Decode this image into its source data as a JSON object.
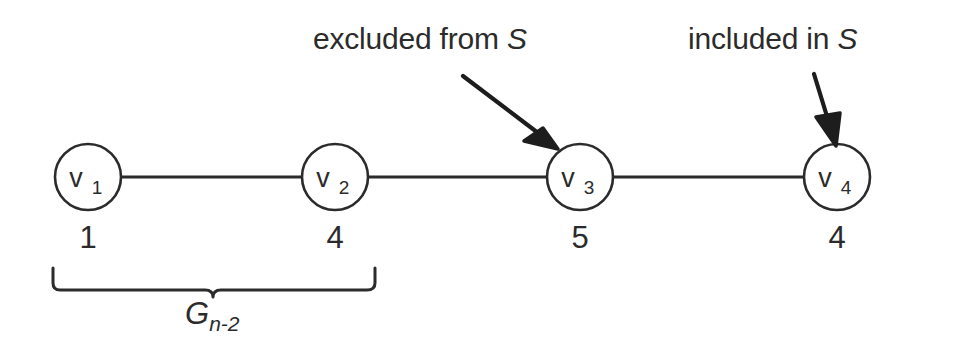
{
  "diagram": {
    "background_color": "#ffffff",
    "stroke_color": "#2b2b2b",
    "node_fill": "#ffffff",
    "callouts": [
      {
        "id": "excluded",
        "text_prefix": "excluded from ",
        "set_name": "S",
        "full_text": "excluded from S",
        "points_to": "v3"
      },
      {
        "id": "included",
        "text_prefix": "included in ",
        "set_name": "S",
        "full_text": "included in S",
        "points_to": "v4"
      }
    ],
    "nodes": [
      {
        "id": "v1",
        "label": "v",
        "subscript": "1",
        "weight": "1",
        "cx": 88,
        "cy": 177,
        "r": 33
      },
      {
        "id": "v2",
        "label": "v",
        "subscript": "2",
        "weight": "4",
        "cx": 335,
        "cy": 177,
        "r": 33
      },
      {
        "id": "v3",
        "label": "v",
        "subscript": "3",
        "weight": "5",
        "cx": 580,
        "cy": 177,
        "r": 33
      },
      {
        "id": "v4",
        "label": "v",
        "subscript": "4",
        "weight": "4",
        "cx": 837,
        "cy": 177,
        "r": 33
      }
    ],
    "edges": [
      {
        "id": "e1",
        "from": "v1",
        "to": "v2"
      },
      {
        "id": "e2",
        "from": "v2",
        "to": "v3"
      },
      {
        "id": "e3",
        "from": "v3",
        "to": "v4"
      }
    ],
    "brace": {
      "id": "subgraph-brace",
      "label_base": "G",
      "label_subscript": "n-2",
      "full_label": "G n-2",
      "spans_nodes": [
        "v1",
        "v2"
      ],
      "left_x": 52,
      "right_x": 376,
      "y": 272
    }
  }
}
